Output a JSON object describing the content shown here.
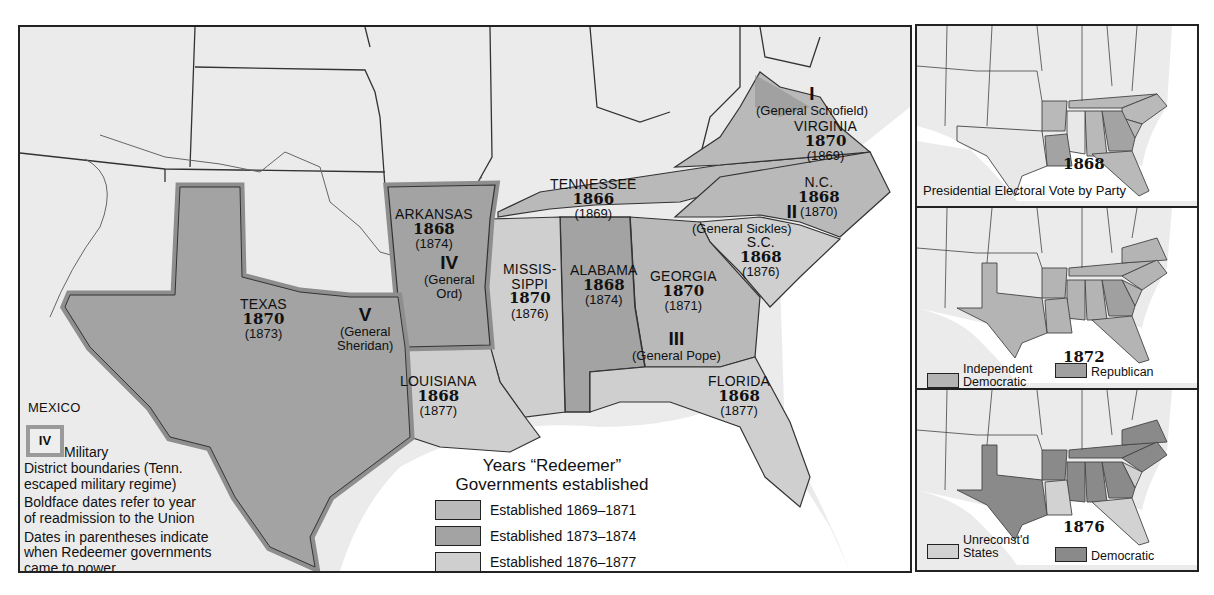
{
  "colors": {
    "background": "#ebebeb",
    "water": "#ffffff",
    "border": "#333333",
    "established_1869_1871": "#b9b9b9",
    "established_1873_1874": "#a3a3a3",
    "established_1876_1877": "#cfcfcf",
    "military_boundary": "#8e8e8e",
    "inset_independent_democratic": "#b4b4b4",
    "inset_republican": "#a0a0a0",
    "inset_unreconstructed": "#d2d2d2",
    "inset_democratic": "#8a8a8a"
  },
  "main_map": {
    "states": [
      {
        "id": "virginia",
        "name": "VIRGINIA",
        "readmission": "1870",
        "redeemer": "(1869)"
      },
      {
        "id": "north-carolina",
        "name": "N.C.",
        "readmission": "1868",
        "redeemer": "(1870)"
      },
      {
        "id": "south-carolina",
        "name": "S.C.",
        "readmission": "1868",
        "redeemer": "(1876)"
      },
      {
        "id": "tennessee",
        "name": "TENNESSEE",
        "readmission": "1866",
        "redeemer": "(1869)"
      },
      {
        "id": "arkansas",
        "name": "ARKANSAS",
        "readmission": "1868",
        "redeemer": "(1874)"
      },
      {
        "id": "mississippi",
        "name": "MISSIS-\nSIPPI",
        "readmission": "1870",
        "redeemer": "(1876)"
      },
      {
        "id": "alabama",
        "name": "ALABAMA",
        "readmission": "1868",
        "redeemer": "(1874)"
      },
      {
        "id": "georgia",
        "name": "GEORGIA",
        "readmission": "1870",
        "redeemer": "(1871)"
      },
      {
        "id": "texas",
        "name": "TEXAS",
        "readmission": "1870",
        "redeemer": "(1873)"
      },
      {
        "id": "louisiana",
        "name": "LOUISIANA",
        "readmission": "1868",
        "redeemer": "(1877)"
      },
      {
        "id": "florida",
        "name": "FLORIDA",
        "readmission": "1868",
        "redeemer": "(1877)"
      }
    ],
    "districts": [
      {
        "numeral": "I",
        "general": "(General Schofield)"
      },
      {
        "numeral": "II",
        "general": "(General Sickles)"
      },
      {
        "numeral": "III",
        "general": "(General Pope)"
      },
      {
        "numeral": "IV",
        "general": "(General\nOrd)"
      },
      {
        "numeral": "V",
        "general": "(General\nSheridan)"
      }
    ],
    "mexico_label": "MEXICO",
    "notes": {
      "military_badge": "IV",
      "military_label": "Military",
      "line1": "District boundaries (Tenn.",
      "line2": "escaped military regime)",
      "line3": "Boldface dates refer to year",
      "line4": "of readmission to the Union",
      "line5": "Dates in parentheses indicate",
      "line6": "when Redeemer governments",
      "line7": "came to power"
    },
    "legend": {
      "title_line1": "Years “Redeemer”",
      "title_line2": "Governments established",
      "items": [
        {
          "label": "Established 1869–1871"
        },
        {
          "label": "Established 1873–1874"
        },
        {
          "label": "Established 1876–1877"
        }
      ]
    }
  },
  "insets": {
    "caption": "Presidential Electoral Vote by Party",
    "i1868": {
      "year": "1868"
    },
    "i1872": {
      "year": "1872",
      "legend": [
        {
          "label": "Independent\nDemocratic"
        },
        {
          "label": "Republican"
        }
      ]
    },
    "i1876": {
      "year": "1876",
      "legend": [
        {
          "label": "Unreconst'd\nStates"
        },
        {
          "label": "Democratic"
        }
      ]
    }
  }
}
